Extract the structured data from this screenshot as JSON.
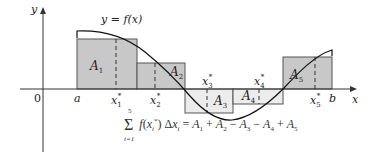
{
  "diagram": {
    "curve_label": "y = f(x)",
    "axes": {
      "x_label": "x",
      "y_label": "y",
      "origin_label": "0",
      "a_label": "a",
      "b_label": "b"
    },
    "sample_points": [
      "x1*",
      "x2*",
      "x3*",
      "x4*",
      "x5*"
    ],
    "rectangles": [
      {
        "label": "A1",
        "sign": "positive",
        "fill": "#c8c8c8"
      },
      {
        "label": "A2",
        "sign": "positive",
        "fill": "#c8c8c8"
      },
      {
        "label": "A3",
        "sign": "negative",
        "fill": "#ececec"
      },
      {
        "label": "A4",
        "sign": "negative",
        "fill": "#ececec"
      },
      {
        "label": "A5",
        "sign": "positive",
        "fill": "#c8c8c8"
      }
    ],
    "formula": {
      "sum_upper": "5",
      "sum_lower": "i=1",
      "expression": "f(xi*) Δxi = A1 + A2 − A3 − A4 + A5"
    },
    "colors": {
      "positive_fill": "#c8c8c8",
      "negative_fill": "#ececec",
      "stroke": "#333333",
      "curve": "#111111"
    }
  }
}
